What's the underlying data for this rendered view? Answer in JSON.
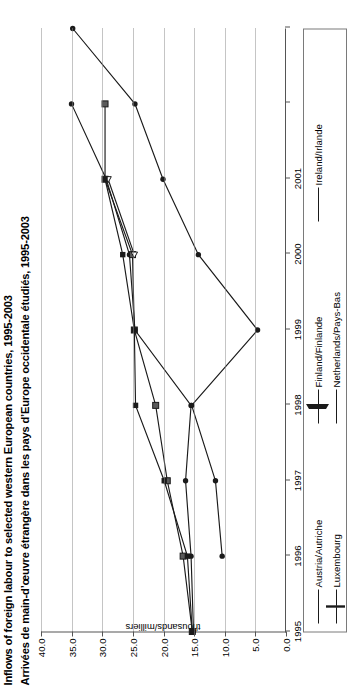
{
  "figure": {
    "title_en": "Inflows of foreign labour to selected western European countries, 1995-2003",
    "title_fr": "Arrivées de main-d’œuvre étrangère dans les pays d’Europe occidentale étudiés, 1995-2003",
    "orientation": "rotated-90"
  },
  "chart_data": {
    "type": "line",
    "title": "Inflows of foreign labour to selected western European countries, 1995-2003",
    "subtitle": "Arrivées de main-d’œuvre étrangère dans les pays d’Europe occidentale étudiés, 1995-2003",
    "xlabel": "",
    "ylabel": "thousands/milliers",
    "x": [
      1995,
      1996,
      1997,
      1998,
      1999,
      2000,
      2001,
      2002,
      2003
    ],
    "xlim": [
      1995,
      2003
    ],
    "ylim": [
      0.0,
      40.0
    ],
    "xticks": [
      "1995",
      "1996",
      "1997",
      "1998",
      "1999",
      "2000",
      "2001"
    ],
    "yticks": [
      "0.0",
      "5.0",
      "10.0",
      "15.0",
      "20.0",
      "25.0",
      "30.0",
      "35.0",
      "40.0"
    ],
    "grid": "y-gridlines-dotted",
    "legend_position": "below-plot",
    "series": [
      {
        "name": "Austria/Autriche",
        "marker": "filled-circle",
        "x": [
          1995,
          1996,
          1997,
          1998,
          1999,
          2000,
          2001,
          2002
        ],
        "values": [
          15.0,
          15.4,
          16.3,
          15.4,
          24.6,
          25.5,
          29.3,
          35.0
        ]
      },
      {
        "name": "Luxembourg",
        "marker": "square",
        "x": [
          1995,
          1996,
          1997,
          1998,
          1999,
          2000,
          2001,
          2002
        ],
        "values": [
          15.2,
          16.7,
          19.3,
          21.2,
          24.7,
          25.0,
          29.5,
          29.5
        ]
      },
      {
        "name": "Finland/Finlande",
        "marker": "open-triangle",
        "x": [
          2000,
          2001
        ],
        "values": [
          24.7,
          29.0
        ]
      },
      {
        "name": "Netherlands/Pays-Bas",
        "marker": "filled-square",
        "x": [
          1995,
          1996,
          1997,
          1998,
          1999,
          2000,
          2001
        ],
        "values": [
          15.2,
          16.0,
          19.8,
          24.5,
          24.7,
          26.6,
          29.5
        ]
      },
      {
        "name": "Ireland/Irlande",
        "marker": "filled-circle",
        "x": [
          1996,
          1997,
          1998,
          1999,
          2000,
          2001,
          2002,
          2003
        ],
        "values": [
          10.3,
          11.4,
          15.3,
          4.5,
          14.2,
          20.0,
          24.6,
          34.8
        ]
      }
    ]
  },
  "legend": {
    "items": [
      {
        "label": "Austria/Autriche",
        "marker": "filled-circle"
      },
      {
        "label": "Finland/Finlande",
        "marker": "open-triangle"
      },
      {
        "label": "Ireland/Irlande",
        "marker": "filled-circle"
      },
      {
        "label": "Luxembourg",
        "marker": "square"
      },
      {
        "label": "Netherlands/Pays-Bas",
        "marker": "filled-square"
      }
    ]
  },
  "axes": {
    "y_title": "thousands/milliers",
    "y_ticks": [
      "0.0",
      "5.0",
      "10.0",
      "15.0",
      "20.0",
      "25.0",
      "30.0",
      "35.0",
      "40.0"
    ],
    "x_ticks": [
      "1995",
      "1996",
      "1997",
      "1998",
      "1999",
      "2000",
      "2001"
    ]
  },
  "colors": {
    "line": "#1a1a1a",
    "grid": "#8a8a8a",
    "axis": "#555555",
    "legend_border": "#7a7a7a",
    "background": "#ffffff"
  }
}
